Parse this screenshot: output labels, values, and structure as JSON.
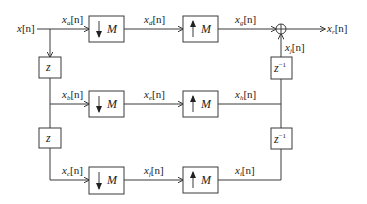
{
  "diagram": {
    "title": "",
    "input": {
      "base": "x",
      "sub": "",
      "arg": "[n]"
    },
    "output": {
      "base": "x",
      "sub": "r",
      "arg": "[n]"
    },
    "signals": {
      "a": {
        "base": "x",
        "sub": "a",
        "arg": "[n]"
      },
      "b": {
        "base": "x",
        "sub": "b",
        "arg": "[n]"
      },
      "c": {
        "base": "x",
        "sub": "c",
        "arg": "[n]"
      },
      "d": {
        "base": "x",
        "sub": "d",
        "arg": "[n]"
      },
      "e": {
        "base": "x",
        "sub": "e",
        "arg": "[n]"
      },
      "f": {
        "base": "x",
        "sub": "f",
        "arg": "[n]"
      },
      "g": {
        "base": "x",
        "sub": "g",
        "arg": "[n]"
      },
      "h": {
        "base": "x",
        "sub": "h",
        "arg": "[n]"
      },
      "i": {
        "base": "x",
        "sub": "i",
        "arg": "[n]"
      },
      "j": {
        "base": "x",
        "sub": "j",
        "arg": "[n]"
      }
    },
    "blocks": {
      "downsample_label": "M",
      "upsample_label": "M",
      "delay_forward": "z",
      "delay_inverse_base": "z",
      "delay_inverse_exp": "−1"
    },
    "nodes": {
      "adder_symbol": "⊕"
    },
    "colors": {
      "line": "#3a3a3a",
      "text": "#222222",
      "background": "#ffffff"
    }
  }
}
